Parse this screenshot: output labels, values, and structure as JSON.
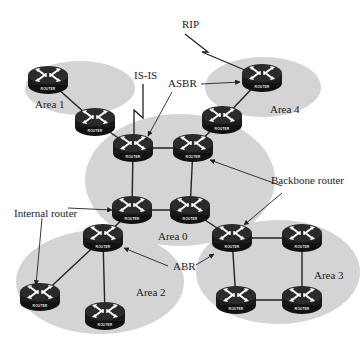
{
  "diagram": {
    "type": "OSPF multi-area network topology",
    "colors": {
      "area_fill": "#d4d4d4",
      "router_body": "#1e1e1e",
      "link": "#222222",
      "background": "#ffffff"
    },
    "router_badge": "ROUTER",
    "areas": [
      {
        "id": "area0",
        "label": "Area 0",
        "cx": 180,
        "cy": 180,
        "rx": 95,
        "ry": 66,
        "label_x": 158,
        "label_y": 240
      },
      {
        "id": "area1",
        "label": "Area 1",
        "cx": 80,
        "cy": 88,
        "rx": 55,
        "ry": 27,
        "label_x": 35,
        "label_y": 108
      },
      {
        "id": "area2",
        "label": "Area 2",
        "cx": 100,
        "cy": 282,
        "rx": 84,
        "ry": 52,
        "label_x": 136,
        "label_y": 296
      },
      {
        "id": "area3",
        "label": "Area 3",
        "cx": 278,
        "cy": 272,
        "rx": 82,
        "ry": 52,
        "label_x": 314,
        "label_y": 279
      },
      {
        "id": "area4",
        "label": "Area 4",
        "cx": 263,
        "cy": 87,
        "rx": 58,
        "ry": 30,
        "label_x": 270,
        "label_y": 113
      }
    ],
    "routers": [
      {
        "id": "r-area1",
        "x": 48,
        "y": 80
      },
      {
        "id": "r-area1-abr",
        "x": 95,
        "y": 122
      },
      {
        "id": "r-a0-tl",
        "x": 133,
        "y": 148
      },
      {
        "id": "r-a0-tr",
        "x": 193,
        "y": 148
      },
      {
        "id": "r-area4",
        "x": 262,
        "y": 78
      },
      {
        "id": "r-area4-abr",
        "x": 222,
        "y": 120
      },
      {
        "id": "r-a0-bl",
        "x": 132,
        "y": 210
      },
      {
        "id": "r-a0-br",
        "x": 190,
        "y": 210
      },
      {
        "id": "r-area2-abr",
        "x": 103,
        "y": 238
      },
      {
        "id": "r-area2-left",
        "x": 40,
        "y": 297
      },
      {
        "id": "r-area2-bottom",
        "x": 105,
        "y": 316
      },
      {
        "id": "r-a3-tl",
        "x": 232,
        "y": 238
      },
      {
        "id": "r-a3-tr",
        "x": 302,
        "y": 238
      },
      {
        "id": "r-a3-bl",
        "x": 236,
        "y": 300
      },
      {
        "id": "r-a3-br",
        "x": 302,
        "y": 300
      }
    ],
    "links": [
      [
        "r-area1",
        "r-area1-abr"
      ],
      [
        "r-area1-abr",
        "r-a0-tl"
      ],
      [
        "r-a0-tl",
        "r-a0-tr"
      ],
      [
        "r-a0-tl",
        "r-a0-bl"
      ],
      [
        "r-a0-tr",
        "r-a0-br"
      ],
      [
        "r-a0-bl",
        "r-a0-br"
      ],
      [
        "r-a0-tr",
        "r-area4-abr"
      ],
      [
        "r-area4-abr",
        "r-area4"
      ],
      [
        "r-a0-bl",
        "r-area2-abr"
      ],
      [
        "r-area2-abr",
        "r-area2-left"
      ],
      [
        "r-area2-abr",
        "r-area2-bottom"
      ],
      [
        "r-a0-br",
        "r-a3-tl"
      ],
      [
        "r-a3-tl",
        "r-a3-tr"
      ],
      [
        "r-a3-tl",
        "r-a3-bl"
      ],
      [
        "r-a3-tr",
        "r-a3-br"
      ],
      [
        "r-a3-bl",
        "r-a3-br"
      ]
    ],
    "annotations": {
      "rip": {
        "text": "RIP",
        "x": 182,
        "y": 28
      },
      "isis": {
        "text": "IS-IS",
        "x": 134,
        "y": 79
      },
      "asbr": {
        "text": "ASBR",
        "x": 168,
        "y": 87
      },
      "backbone_router": {
        "text": "Backbone router",
        "x": 271,
        "y": 184
      },
      "internal_router": {
        "text": "Internal router",
        "x": 14,
        "y": 217
      },
      "abr": {
        "text": "ABR",
        "x": 173,
        "y": 270
      }
    }
  }
}
